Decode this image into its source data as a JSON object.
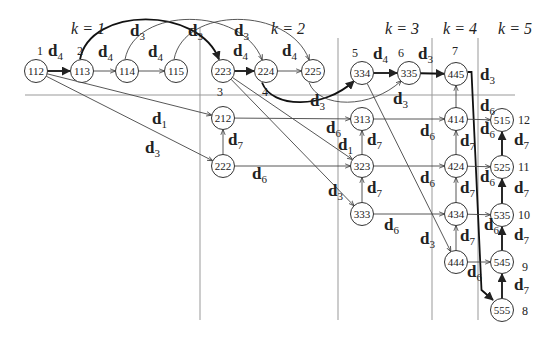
{
  "diagram": {
    "type": "directed-graph",
    "stage_labels": [
      {
        "id": "k1",
        "text": "k = 1",
        "x": 88,
        "y": 34
      },
      {
        "id": "k2",
        "text": "k = 2",
        "x": 288,
        "y": 34
      },
      {
        "id": "k3",
        "text": "k = 3",
        "x": 402,
        "y": 34
      },
      {
        "id": "k4",
        "text": "k = 4",
        "x": 460,
        "y": 34
      },
      {
        "id": "k5",
        "text": "k = 5",
        "x": 515,
        "y": 34
      }
    ],
    "separators": {
      "horizontal": {
        "x1": 25,
        "x2": 515,
        "y": 95
      },
      "vertical": [
        {
          "x": 200,
          "y1": 28,
          "y2": 320
        },
        {
          "x": 338,
          "y1": 38,
          "y2": 320
        },
        {
          "x": 432,
          "y1": 38,
          "y2": 320
        },
        {
          "x": 478,
          "y1": 38,
          "y2": 320
        }
      ]
    },
    "nodes": [
      {
        "id": "112",
        "x": 36,
        "y": 71,
        "index": "1",
        "ix": 37,
        "iy": 55
      },
      {
        "id": "113",
        "x": 82,
        "y": 71,
        "index": "2",
        "ix": 77,
        "iy": 55
      },
      {
        "id": "114",
        "x": 127,
        "y": 71
      },
      {
        "id": "115",
        "x": 176,
        "y": 71
      },
      {
        "id": "223",
        "x": 223,
        "y": 71,
        "index": "3",
        "ix": 217,
        "iy": 96
      },
      {
        "id": "224",
        "x": 266,
        "y": 71,
        "index": "4",
        "ix": 262,
        "iy": 96
      },
      {
        "id": "225",
        "x": 313,
        "y": 71
      },
      {
        "id": "334",
        "x": 362,
        "y": 73,
        "index": "5",
        "ix": 352,
        "iy": 57
      },
      {
        "id": "335",
        "x": 409,
        "y": 73,
        "index": "6",
        "ix": 398,
        "iy": 57
      },
      {
        "id": "445",
        "x": 456,
        "y": 74,
        "index": "7",
        "ix": 452,
        "iy": 55
      },
      {
        "id": "212",
        "x": 223,
        "y": 118
      },
      {
        "id": "222",
        "x": 223,
        "y": 166
      },
      {
        "id": "313",
        "x": 362,
        "y": 119
      },
      {
        "id": "323",
        "x": 362,
        "y": 166
      },
      {
        "id": "333",
        "x": 362,
        "y": 214
      },
      {
        "id": "414",
        "x": 456,
        "y": 119
      },
      {
        "id": "424",
        "x": 456,
        "y": 166
      },
      {
        "id": "434",
        "x": 456,
        "y": 214
      },
      {
        "id": "444",
        "x": 456,
        "y": 262
      },
      {
        "id": "515",
        "x": 502,
        "y": 120,
        "index": "12",
        "ix": 518,
        "iy": 124
      },
      {
        "id": "525",
        "x": 502,
        "y": 167,
        "index": "11",
        "ix": 518,
        "iy": 171
      },
      {
        "id": "535",
        "x": 502,
        "y": 215,
        "index": "10",
        "ix": 518,
        "iy": 219
      },
      {
        "id": "545",
        "x": 502,
        "y": 262,
        "index": "9",
        "ix": 522,
        "iy": 271
      },
      {
        "id": "555",
        "x": 502,
        "y": 310,
        "index": "8",
        "ix": 522,
        "iy": 315
      }
    ],
    "edges": [
      {
        "from": "112",
        "to": "113",
        "label": "d4",
        "bold": true
      },
      {
        "from": "113",
        "to": "114",
        "label": "d4"
      },
      {
        "from": "114",
        "to": "115",
        "label": "d4"
      },
      {
        "from": "223",
        "to": "224",
        "label": "d4",
        "bold": true
      },
      {
        "from": "224",
        "to": "225",
        "label": "d4"
      },
      {
        "from": "334",
        "to": "335",
        "label": "d4",
        "bold": true
      },
      {
        "from": "335",
        "to": "445",
        "label": "d3",
        "bold": true
      },
      {
        "from": "113",
        "to": "223",
        "label": "d3",
        "bold": true,
        "curve": "arc-up"
      },
      {
        "from": "114",
        "to": "224",
        "label": "d3",
        "curve": "arc-up"
      },
      {
        "from": "115",
        "to": "225",
        "label": "d3",
        "curve": "arc-up"
      },
      {
        "from": "224",
        "to": "334",
        "label": "d3",
        "bold": true,
        "curve": "arc-down"
      },
      {
        "from": "225",
        "to": "335",
        "label": "d3",
        "curve": "arc-down"
      },
      {
        "from": "112",
        "to": "212",
        "label": "d1"
      },
      {
        "from": "112",
        "to": "222",
        "label": "d3"
      },
      {
        "from": "222",
        "to": "212",
        "label": "d7"
      },
      {
        "from": "212",
        "to": "313",
        "label": "d6"
      },
      {
        "from": "222",
        "to": "323",
        "label": "d6"
      },
      {
        "from": "223",
        "to": "323",
        "label": "d1"
      },
      {
        "from": "223",
        "to": "333",
        "label": "d3"
      },
      {
        "from": "323",
        "to": "313",
        "label": "d7"
      },
      {
        "from": "333",
        "to": "323",
        "label": "d7"
      },
      {
        "from": "313",
        "to": "414",
        "label": "d6"
      },
      {
        "from": "323",
        "to": "424",
        "label": "d6"
      },
      {
        "from": "333",
        "to": "434",
        "label": "d6"
      },
      {
        "from": "334",
        "to": "444",
        "label": "d3"
      },
      {
        "from": "414",
        "to": "445",
        "label": ""
      },
      {
        "from": "424",
        "to": "414",
        "label": "d7"
      },
      {
        "from": "434",
        "to": "424",
        "label": "d7"
      },
      {
        "from": "444",
        "to": "434",
        "label": "d7"
      },
      {
        "from": "445",
        "to": "555",
        "label": "d3",
        "bold": true
      },
      {
        "from": "414",
        "to": "515",
        "label": "d6"
      },
      {
        "from": "424",
        "to": "525",
        "label": "d6"
      },
      {
        "from": "434",
        "to": "535",
        "label": "d6"
      },
      {
        "from": "444",
        "to": "545",
        "label": "d6"
      },
      {
        "from": "525",
        "to": "515",
        "label": "d7",
        "bold": true
      },
      {
        "from": "535",
        "to": "525",
        "label": "d7",
        "bold": true
      },
      {
        "from": "545",
        "to": "535",
        "label": "d7",
        "bold": true
      },
      {
        "from": "555",
        "to": "545",
        "label": "d7",
        "bold": true
      }
    ],
    "edge_labels": [
      {
        "base": "d",
        "sub": "4",
        "x": 48,
        "y": 56
      },
      {
        "base": "d",
        "sub": "4",
        "x": 98,
        "y": 57
      },
      {
        "base": "d",
        "sub": "4",
        "x": 148,
        "y": 57
      },
      {
        "base": "d",
        "sub": "3",
        "x": 130,
        "y": 36
      },
      {
        "base": "d",
        "sub": "3",
        "x": 188,
        "y": 36
      },
      {
        "base": "d",
        "sub": "3",
        "x": 234,
        "y": 36
      },
      {
        "base": "d",
        "sub": "4",
        "x": 233,
        "y": 56
      },
      {
        "base": "d",
        "sub": "4",
        "x": 282,
        "y": 56
      },
      {
        "base": "d",
        "sub": "3",
        "x": 310,
        "y": 106
      },
      {
        "base": "d",
        "sub": "4",
        "x": 373,
        "y": 59
      },
      {
        "base": "d",
        "sub": "3",
        "x": 418,
        "y": 59
      },
      {
        "base": "d",
        "sub": "3",
        "x": 393,
        "y": 104
      },
      {
        "base": "d",
        "sub": "3",
        "x": 480,
        "y": 80
      },
      {
        "base": "d",
        "sub": "1",
        "x": 152,
        "y": 124
      },
      {
        "base": "d",
        "sub": "3",
        "x": 145,
        "y": 153
      },
      {
        "base": "d",
        "sub": "7",
        "x": 228,
        "y": 145
      },
      {
        "base": "d",
        "sub": "6",
        "x": 252,
        "y": 179
      },
      {
        "base": "d",
        "sub": "6",
        "x": 326,
        "y": 133
      },
      {
        "base": "d",
        "sub": "1",
        "x": 338,
        "y": 150
      },
      {
        "base": "d",
        "sub": "7",
        "x": 367,
        "y": 145
      },
      {
        "base": "d",
        "sub": "7",
        "x": 367,
        "y": 193
      },
      {
        "base": "d",
        "sub": "3",
        "x": 328,
        "y": 196
      },
      {
        "base": "d",
        "sub": "6",
        "x": 384,
        "y": 230
      },
      {
        "base": "d",
        "sub": "6",
        "x": 420,
        "y": 136
      },
      {
        "base": "d",
        "sub": "6",
        "x": 420,
        "y": 183
      },
      {
        "base": "d",
        "sub": "3",
        "x": 420,
        "y": 244
      },
      {
        "base": "d",
        "sub": "7",
        "x": 460,
        "y": 146
      },
      {
        "base": "d",
        "sub": "7",
        "x": 460,
        "y": 193
      },
      {
        "base": "d",
        "sub": "7",
        "x": 460,
        "y": 241
      },
      {
        "base": "d",
        "sub": "6",
        "x": 480,
        "y": 111
      },
      {
        "base": "d",
        "sub": "6",
        "x": 480,
        "y": 134
      },
      {
        "base": "d",
        "sub": "6",
        "x": 480,
        "y": 182
      },
      {
        "base": "d",
        "sub": "6",
        "x": 484,
        "y": 230
      },
      {
        "base": "d",
        "sub": "6",
        "x": 467,
        "y": 277
      },
      {
        "base": "d",
        "sub": "7",
        "x": 514,
        "y": 145
      },
      {
        "base": "d",
        "sub": "7",
        "x": 514,
        "y": 193
      },
      {
        "base": "d",
        "sub": "7",
        "x": 514,
        "y": 240
      },
      {
        "base": "d",
        "sub": "7",
        "x": 514,
        "y": 290
      }
    ]
  }
}
